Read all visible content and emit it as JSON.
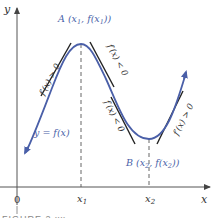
{
  "figure": {
    "axes": {
      "x_label": "x",
      "y_label": "y",
      "origin_label": "0",
      "x_ticks": [
        {
          "label": "x",
          "sub": "1",
          "x": 81
        },
        {
          "label": "x",
          "sub": "2",
          "x": 149
        }
      ]
    },
    "curve": {
      "label": "y = f(x)",
      "color": "#4a5fa8"
    },
    "points": {
      "A": {
        "label": "A (x",
        "sub1": "1",
        "mid": ", f(x",
        "sub2": "1",
        "end": "))"
      },
      "B": {
        "label": "B (x",
        "sub1": "2",
        "mid": ", f(x",
        "sub2": "2",
        "end": "))"
      }
    },
    "tangent_labels": [
      {
        "text": "f′(x) > 0",
        "position": "left-rising"
      },
      {
        "text": "f′(x) < 0",
        "position": "upper-falling"
      },
      {
        "text": "f′(x) < 0",
        "position": "lower-falling"
      },
      {
        "text": "f′(x) > 0",
        "position": "right-rising"
      }
    ],
    "caption": "FIGURE 2.xx",
    "colors": {
      "curve": "#4a5fa8",
      "axes": "#333333",
      "tangent": "#222222",
      "label_blue": "#4a5fa8"
    }
  }
}
